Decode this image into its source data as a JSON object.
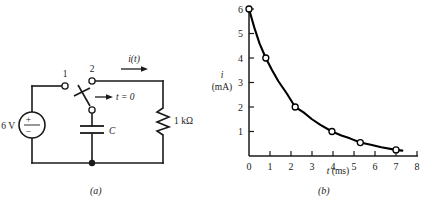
{
  "figure": {
    "panels": [
      {
        "id": "a",
        "caption": "(a)",
        "kind": "circuit-schematic"
      },
      {
        "id": "b",
        "caption": "(b)",
        "kind": "chart"
      }
    ]
  },
  "circuit": {
    "source_label": "6 V",
    "source_plus": "+",
    "source_minus": "−",
    "terminal_1_label": "1",
    "terminal_2_label": "2",
    "switch_label": "t = 0",
    "capacitor_label": "C",
    "resistor_label": "1 kΩ",
    "current_label": "i(t)",
    "wire_color": "#1a1a1a"
  },
  "chart_data": {
    "type": "line",
    "title": "",
    "xlabel": "t (ms)",
    "ylabel": "i\n(mA)",
    "ylabel_symbol": "i",
    "ylabel_unit": "(mA)",
    "xlim": [
      0,
      8
    ],
    "ylim": [
      0,
      6
    ],
    "xticks": [
      0,
      1,
      2,
      3,
      4,
      5,
      6,
      7,
      8
    ],
    "yticks": [
      1,
      2,
      3,
      4,
      5,
      6
    ],
    "xtick_labels": [
      "0",
      "1",
      "2",
      "3",
      "4",
      "5",
      "6",
      "7",
      "8"
    ],
    "ytick_labels": [
      "1",
      "2",
      "3",
      "4",
      "5",
      "6"
    ],
    "grid": false,
    "legend": null,
    "series": [
      {
        "name": "i(t) = 6e^(-t/1.8) mA",
        "marker": "open-circle",
        "color": "#000000",
        "markers_x": [
          0.0,
          0.8,
          2.2,
          3.95,
          5.3,
          7.0
        ],
        "markers_y": [
          6.0,
          4.0,
          2.0,
          1.0,
          0.55,
          0.25
        ],
        "x": [
          0.0,
          0.25,
          0.5,
          0.8,
          1.1,
          1.4,
          1.8,
          2.2,
          2.6,
          3.0,
          3.4,
          3.95,
          4.4,
          4.8,
          5.3,
          5.8,
          6.3,
          7.0,
          7.3
        ],
        "y": [
          6.0,
          5.25,
          4.6,
          4.0,
          3.5,
          3.05,
          2.55,
          2.0,
          1.78,
          1.5,
          1.27,
          1.0,
          0.84,
          0.72,
          0.55,
          0.46,
          0.36,
          0.25,
          0.22
        ]
      }
    ]
  }
}
